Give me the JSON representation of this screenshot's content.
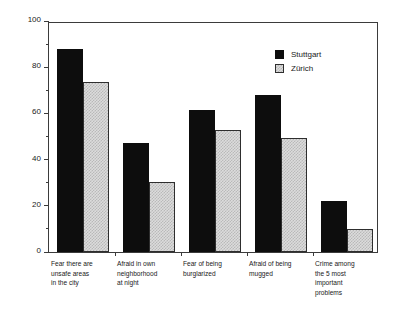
{
  "chart_data": {
    "type": "bar",
    "title": "",
    "xlabel": "",
    "ylabel": "Percent",
    "ylim": [
      0,
      100
    ],
    "ytick_labels": [
      "0",
      "20",
      "40",
      "60",
      "80",
      "100"
    ],
    "ytick_values": [
      0,
      20,
      40,
      60,
      80,
      100
    ],
    "yminor_values": [
      10,
      30,
      50,
      70,
      90
    ],
    "grid": false,
    "legend_position": "top-right",
    "categories": [
      "Fear there are unsafe areas in the city",
      "Afraid in own neighborhood at night",
      "Fear of being burglarized",
      "Afraid of being mugged",
      "Crime among the 5 most important problems"
    ],
    "category_lines": [
      [
        "Fear there are",
        "unsafe areas",
        "in the city"
      ],
      [
        "Afraid in own",
        "neighborhood",
        "at night"
      ],
      [
        "Fear of being",
        "burglarized"
      ],
      [
        "Afraid of being",
        "mugged"
      ],
      [
        "Crime among",
        "the 5 most",
        "important",
        "problems"
      ]
    ],
    "series": [
      {
        "name": "Stuttgart",
        "color": "#0d0d0d",
        "values": [
          88,
          47,
          61.5,
          68,
          22
        ]
      },
      {
        "name": "Zürich",
        "color": "#dcdcdc",
        "values": [
          73.5,
          30.5,
          53,
          49.5,
          10
        ]
      }
    ]
  },
  "legend": {
    "items": [
      {
        "label": "Stuttgart"
      },
      {
        "label": "Zürich"
      }
    ]
  }
}
